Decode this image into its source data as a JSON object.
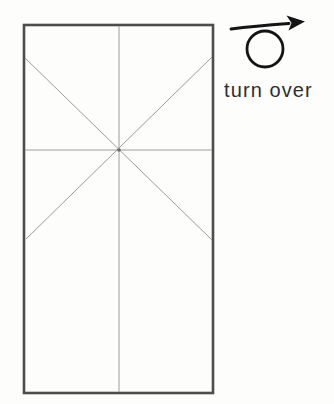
{
  "diagram": {
    "instruction_label": "turn over",
    "symbol": "turn-over-loop-arrow",
    "paper_shape": "rectangle-with-crease-pattern",
    "colors": {
      "background": "#fdfdfc",
      "paper_outline": "#4d4d4d",
      "crease_line": "#9c9c9c",
      "arrow_symbol": "#141414",
      "label_text": "#2e2e2e"
    }
  }
}
